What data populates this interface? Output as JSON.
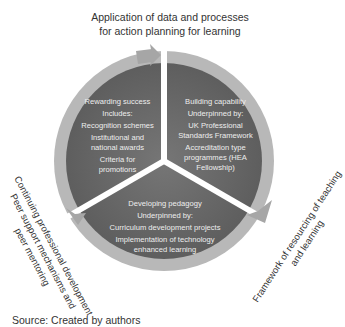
{
  "top_label": {
    "line1": "Application of data and processes",
    "line2": "for action planning for learning"
  },
  "sectors": [
    {
      "id": "rewarding-success",
      "lines": [
        "Rewarding success",
        "Includes:",
        "Recognition schemes",
        "Institutional  and",
        "national awards",
        "Criteria for",
        "promotions"
      ]
    },
    {
      "id": "building-capability",
      "lines": [
        "Building capability",
        "Underpinned by:",
        "UK Professional",
        "Standards Framework",
        "Accreditation type",
        "programmes (HEA",
        "Fellowship)"
      ]
    },
    {
      "id": "developing-pedagogy",
      "lines": [
        "Developing pedagogy",
        "Underpinned by:",
        "Curriculum development projects",
        "Implementation of technology",
        "enhanced learning"
      ]
    }
  ],
  "left_label": {
    "line1": "Continuing professional development",
    "line2": "Peer support mechanisms and",
    "line3": "peer mentoring"
  },
  "right_label": {
    "line1": "Framework of resourcing of teaching",
    "line2": "and learning"
  },
  "source": "Source: Created by authors",
  "colors": {
    "sector_fill": "#6b6b6b",
    "ring_fill": "#b4b4b4",
    "arrow_fill": "#a8a8a8",
    "text_on_sector": "#eeeeee"
  }
}
